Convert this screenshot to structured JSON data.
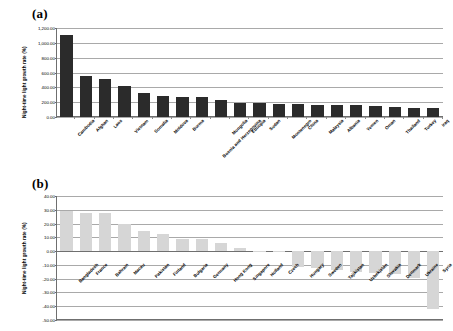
{
  "figure": {
    "panel_a_tag": "(a)",
    "panel_b_tag": "(b)"
  },
  "chart_data": [
    {
      "type": "bar",
      "panel": "(a)",
      "title": "",
      "xlabel": "",
      "ylabel": "Night-time light growth rate (%)",
      "ylim": [
        0,
        1200
      ],
      "ytick_labels": [
        "1,200.00",
        "1,000.00",
        "800.00",
        "600.00",
        "400.00",
        "200.00",
        "0.00"
      ],
      "ytick_values": [
        1200,
        1000,
        800,
        600,
        400,
        200,
        0
      ],
      "grid": true,
      "legend": "none",
      "bar_color": "#2b2b2b",
      "categories": [
        "Cambodia",
        "Afghan",
        "Laos",
        "Vietnam",
        "Somalia",
        "Moldova",
        "Burma",
        "Bosnia and Herzegovina",
        "Mongolia",
        "Ethiopia",
        "Sudan",
        "Montenegro",
        "China",
        "Malaysia",
        "Albania",
        "Yemen",
        "Oman",
        "Thailand",
        "Turkey",
        "Iraq"
      ],
      "values": [
        1100,
        548,
        512,
        420,
        322,
        280,
        272,
        272,
        235,
        192,
        190,
        178,
        172,
        162,
        160,
        158,
        155,
        130,
        118,
        122
      ]
    },
    {
      "type": "bar",
      "panel": "(b)",
      "title": "",
      "xlabel": "",
      "ylabel": "Night-time light growth rate (%)",
      "ylim": [
        -50,
        40
      ],
      "ytick_labels": [
        "40.00",
        "30.00",
        "20.00",
        "10.00",
        "0.00",
        "-10.00",
        "-20.00",
        "-30.00",
        "-40.00",
        "-50.00"
      ],
      "ytick_values": [
        40,
        30,
        20,
        10,
        0,
        -10,
        -20,
        -30,
        -40,
        -50
      ],
      "grid": true,
      "legend": "none",
      "bar_color": "#d6d6d6",
      "categories": [
        "Bangladesh",
        "France",
        "Bahrain",
        "Macau",
        "Pakistan",
        "Finland",
        "Bulgaria",
        "Germany",
        "Hong Kong",
        "Singapore",
        "Holland",
        "Czech",
        "Hungary",
        "Sweden",
        "Tajikistan",
        "Uzbekistan",
        "Slovakia",
        "Denmark",
        "Ukraine",
        "Syria"
      ],
      "values": [
        29.0,
        27.8,
        27.3,
        20.0,
        14.6,
        12.2,
        9.0,
        8.8,
        6.2,
        2.0,
        0.3,
        -0.4,
        -11.5,
        -12.5,
        -13.5,
        -15.0,
        -16.0,
        -16.5,
        -19.5,
        -42.0
      ]
    }
  ]
}
